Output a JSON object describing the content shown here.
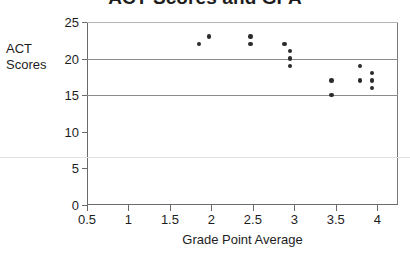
{
  "chart_data": {
    "type": "scatter",
    "title": "ACT Scores and GPA",
    "xlabel": "Grade Point Average",
    "ylabel": "ACT Scores",
    "ylabel_lines": [
      "ACT",
      "Scores"
    ],
    "xlim": [
      0.5,
      4.25
    ],
    "ylim": [
      0,
      25
    ],
    "xticks": [
      0.5,
      1,
      1.5,
      2,
      2.5,
      3,
      3.5,
      4
    ],
    "xtick_labels": [
      "0.5",
      "1",
      "1.5",
      "2",
      "2.5",
      "3",
      "3.5",
      "4"
    ],
    "yticks": [
      0,
      5,
      10,
      15,
      20,
      25
    ],
    "ytick_labels": [
      "0",
      "5",
      "10",
      "15",
      "20",
      "25"
    ],
    "grid": "horizontal",
    "gridlines": [
      15,
      20,
      25
    ],
    "legend": null,
    "marker_color": "#2b2b2b",
    "axis_color": "#6a6a6a",
    "grid_color": "#8b8b8b",
    "points": [
      {
        "x": 1.85,
        "y": 22
      },
      {
        "x": 1.97,
        "y": 23
      },
      {
        "x": 2.47,
        "y": 23
      },
      {
        "x": 2.47,
        "y": 22
      },
      {
        "x": 2.88,
        "y": 22
      },
      {
        "x": 2.95,
        "y": 21
      },
      {
        "x": 2.95,
        "y": 20
      },
      {
        "x": 2.95,
        "y": 19
      },
      {
        "x": 3.45,
        "y": 17
      },
      {
        "x": 3.45,
        "y": 15
      },
      {
        "x": 3.79,
        "y": 19
      },
      {
        "x": 3.79,
        "y": 17
      },
      {
        "x": 3.94,
        "y": 18
      },
      {
        "x": 3.94,
        "y": 17
      },
      {
        "x": 3.94,
        "y": 16
      }
    ]
  }
}
